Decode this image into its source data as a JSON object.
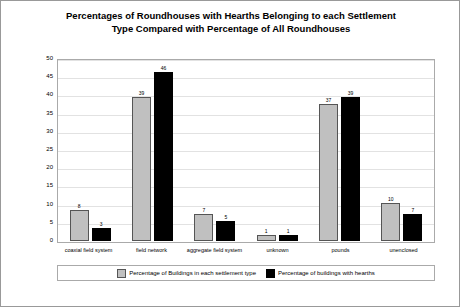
{
  "chart_data": {
    "type": "bar",
    "title": "Percentages of Roundhouses with Hearths Belonging to each Settlement Type Compared with Percentage of All Roundhouses",
    "title_lines": [
      "Percentages of Roundhouses with Hearths Belonging to each Settlement",
      "Type Compared with Percentage of All Roundhouses"
    ],
    "xlabel": "",
    "ylabel": "Percentage of Roundhouses",
    "ylim": [
      0,
      50
    ],
    "yticks": [
      0,
      5,
      10,
      15,
      20,
      25,
      30,
      35,
      40,
      45,
      50
    ],
    "grid": true,
    "legend_position": "bottom",
    "categories": [
      "coaxial field system",
      "field network",
      "aggregate field system",
      "unknown",
      "pounds",
      "unenclosed"
    ],
    "series": [
      {
        "name": "Percentage of Buildings in each settlement type",
        "color": "#c0c0c0",
        "values": [
          8,
          39,
          7,
          1,
          37,
          10
        ]
      },
      {
        "name": "Percentage of buildings with hearths",
        "color": "#000000",
        "values": [
          3,
          46,
          5,
          1,
          39,
          7
        ]
      }
    ]
  }
}
